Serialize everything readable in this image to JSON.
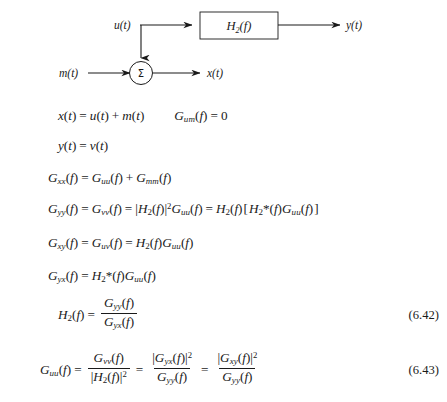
{
  "page": {
    "kind": "textbook-page-excerpt",
    "background_color": "#ffffff",
    "text_color": "#1a1a1a"
  },
  "diagram": {
    "name": "signal-flow-block-diagram",
    "input_top_label": "u(t)",
    "input_bottom_label": "m(t)",
    "block_label_base": "H",
    "block_label_subscript": "2",
    "block_label_arg": "(f)",
    "output_top_label": "y(t)",
    "output_bottom_label": "x(t)",
    "summing_junction_symbol": "Σ"
  },
  "equations": [
    {
      "id": "eq-x-of-t",
      "text": "x(t) = u(t) + m(t)",
      "second_text": "G_um(f) = 0",
      "number": ""
    },
    {
      "id": "eq-y-of-t",
      "text": "y(t) = v(t)",
      "number": ""
    },
    {
      "id": "eq-gxx",
      "text": "G_xx(f) = G_uu(f) + G_mm(f)",
      "number": ""
    },
    {
      "id": "eq-gyy",
      "text": "G_yy(f) = G_vv(f) = |H_2(f)|^2 G_uu(f) = H_2(f)[H_2*(f)G_uu(f)]",
      "number": ""
    },
    {
      "id": "eq-gxy",
      "text": "G_xy(f) = G_uv(f) = H_2(f)G_uu(f)",
      "number": ""
    },
    {
      "id": "eq-gyx",
      "text": "G_yx(f) = H_2*(f)G_uu(f)",
      "number": ""
    },
    {
      "id": "eq-h2",
      "text": "H_2(f) = G_yy(f) / G_yx(f)",
      "number": "(6.42)"
    },
    {
      "id": "eq-guu",
      "text": "G_uu(f) = G_vv(f)/|H_2(f)|^2 = |G_yx(f)|^2/G_yy(f) = |G_xy(f)|^2/G_yy(f)",
      "number": "(6.43)"
    }
  ],
  "symbols": {
    "G": "G",
    "H": "H",
    "f_arg": "(f)",
    "t_arg": "(t)",
    "equals": "=",
    "plus": "+",
    "zero": "0",
    "star": "*",
    "two": "2",
    "square": "2",
    "bar": "|",
    "lbracket": "[",
    "rbracket": "]"
  },
  "equation_numbers": {
    "first": "(6.42)",
    "second": "(6.43)"
  }
}
